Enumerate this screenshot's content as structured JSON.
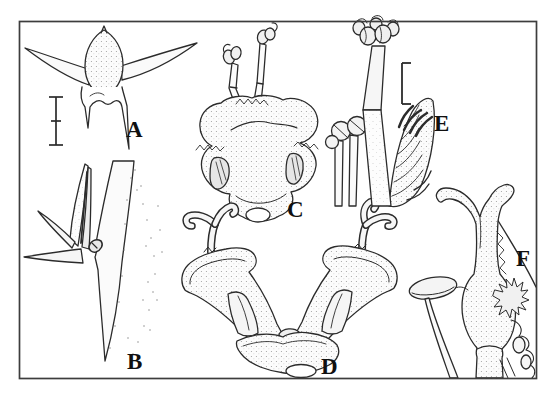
{
  "figure": {
    "background_color": "#ffffff",
    "frame_color": "#3d3d3d",
    "ink_color": "#2b2b2b",
    "panels": [
      {
        "label": "A",
        "name": "horned-fruit-illustration"
      },
      {
        "label": "B",
        "name": "flower-bud-on-spiny-stem-illustration"
      },
      {
        "label": "C",
        "name": "flower-front-view-with-stamens-illustration"
      },
      {
        "label": "D",
        "name": "paired-calyces-with-styles-illustration"
      },
      {
        "label": "E",
        "name": "stamens-and-feathery-stigma-illustration"
      },
      {
        "label": "F",
        "name": "pistil-with-staminode-illustration"
      }
    ],
    "scale_bars": [
      {
        "panel": "A",
        "ticks": 3
      },
      {
        "panel": "E",
        "ticks": 2
      }
    ]
  }
}
